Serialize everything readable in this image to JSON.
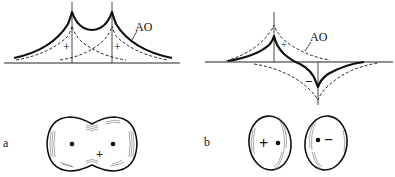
{
  "figure": {
    "panels": [
      {
        "id": "a",
        "label": "a",
        "curve_label": "AO",
        "plot_signs": [
          "+",
          "+"
        ],
        "contour_sign": "+",
        "description": "bonding combination of atomic orbitals"
      },
      {
        "id": "b",
        "label": "b",
        "curve_label": "AO",
        "plot_signs": [
          "+",
          "−"
        ],
        "contour_signs": [
          "+",
          "−"
        ],
        "description": "antibonding combination of atomic orbitals"
      }
    ]
  }
}
